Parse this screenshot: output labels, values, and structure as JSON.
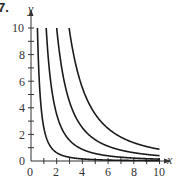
{
  "problem_number": "7.",
  "chart_data": {
    "type": "line",
    "title": "",
    "xlabel": "x",
    "ylabel": "y",
    "xlim": [
      0,
      10
    ],
    "ylim": [
      0,
      10
    ],
    "x_ticks": [
      "0",
      "2",
      "4",
      "6",
      "8",
      "10"
    ],
    "y_ticks": [
      "0",
      "2",
      "4",
      "6",
      "8",
      "10"
    ],
    "grid": false,
    "series": [
      {
        "name": "curve-1",
        "formula": "2.5/x^2"
      },
      {
        "name": "curve-2",
        "formula": "14/x^2"
      },
      {
        "name": "curve-3",
        "formula": "40/x^2"
      },
      {
        "name": "curve-4",
        "formula": "88/x^2"
      }
    ],
    "coefficients": [
      2.5,
      14,
      40,
      88
    ]
  },
  "colors": {
    "axis": "#333333",
    "curve": "#1a1a1a"
  }
}
